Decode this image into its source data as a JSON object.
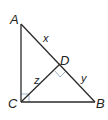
{
  "diagram": {
    "type": "right-triangle-with-altitude",
    "vertices": {
      "A": {
        "label": "A",
        "x": 21,
        "y": 24
      },
      "B": {
        "label": "B",
        "x": 95,
        "y": 102
      },
      "C": {
        "label": "C",
        "x": 21,
        "y": 102
      },
      "D": {
        "label": "D",
        "x": 61,
        "y": 66
      }
    },
    "segment_labels": {
      "x": "x",
      "y": "y",
      "z": "z"
    },
    "right_angles": [
      "C",
      "D"
    ],
    "colors": {
      "line": "#2a2a2a",
      "right_angle_mark": "#9fb3c8"
    }
  }
}
